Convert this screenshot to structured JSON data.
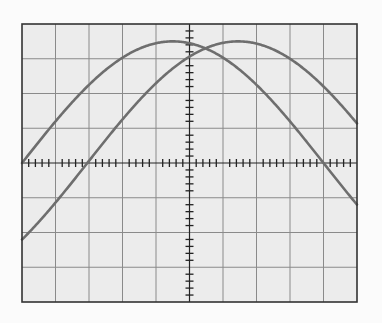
{
  "figure": {
    "colors": {
      "background": "#fbfbfb",
      "screen": "#ececec",
      "grid": "#8a8a8a",
      "border": "#333333",
      "axis": "#222222",
      "trace": "#6e6e6e"
    },
    "grid": {
      "left": 22,
      "top": 24,
      "right": 357,
      "bottom": 302,
      "h_divisions": 10,
      "v_divisions": 8,
      "minor_ticks_per_division": 5
    }
  },
  "chart_data": {
    "type": "line",
    "title": "",
    "xlabel": "",
    "ylabel": "",
    "grid": true,
    "units": "divisions",
    "xlim": [
      -5,
      5
    ],
    "ylim": [
      -4,
      4
    ],
    "series": [
      {
        "name": "Trace A (leading)",
        "amplitude": 3.5,
        "peak_x": -0.5,
        "zero_crossing_up_x": -5.0,
        "zero_crossing_down_x": 4.0,
        "x": [
          -5,
          -4,
          -3,
          -2,
          -1,
          -0.5,
          0,
          1,
          2,
          3,
          4,
          5
        ],
        "values": [
          0,
          1.34,
          2.47,
          3.23,
          3.5,
          3.5,
          3.47,
          3.02,
          2.12,
          1.16,
          0,
          -1.1
        ]
      },
      {
        "name": "Trace B (lagging)",
        "amplitude": 3.5,
        "peak_x": 1.45,
        "zero_crossing_up_x": -3.2,
        "x": [
          -5,
          -4,
          -3,
          -2,
          -1,
          0,
          1,
          1.45,
          2,
          3,
          4,
          5
        ],
        "values": [
          -2.1,
          -0.86,
          0.24,
          1.4,
          2.48,
          3.2,
          3.48,
          3.5,
          3.43,
          2.9,
          1.98,
          0.88
        ]
      }
    ]
  }
}
